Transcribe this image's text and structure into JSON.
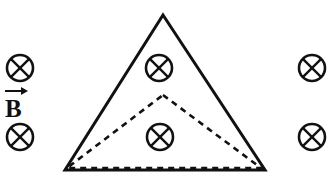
{
  "figure": {
    "background_color": "#ffffff",
    "stroke_color": "#111111",
    "width": 333,
    "height": 190,
    "field_label": {
      "symbol": "B",
      "arrow": "vector-arrow-right",
      "meaning": "magnetic field vector"
    },
    "field_markers": [
      {
        "name": "field-marker-left-top",
        "cx": 20,
        "cy": 68,
        "r": 13,
        "glyph": "circled-x",
        "region": "outside-left"
      },
      {
        "name": "field-marker-left-bottom",
        "cx": 20,
        "cy": 137,
        "r": 13,
        "glyph": "circled-x",
        "region": "outside-left"
      },
      {
        "name": "field-marker-right-top",
        "cx": 312,
        "cy": 68,
        "r": 13,
        "glyph": "circled-x",
        "region": "outside-right"
      },
      {
        "name": "field-marker-right-bottom",
        "cx": 312,
        "cy": 137,
        "r": 13,
        "glyph": "circled-x",
        "region": "outside-right"
      },
      {
        "name": "field-marker-inner-top",
        "cx": 159,
        "cy": 68,
        "r": 13,
        "glyph": "circled-x",
        "region": "inside-triangle"
      },
      {
        "name": "field-marker-inner-bottom",
        "cx": 160,
        "cy": 137,
        "r": 13,
        "glyph": "circled-x",
        "region": "inside-triangle"
      }
    ],
    "solid_triangle": {
      "name": "solid-triangle",
      "points": "163,15 265,170 65,170",
      "style": "solid",
      "stroke_width": 3
    },
    "dashed_triangle": {
      "name": "dashed-triangle",
      "points": "163,95 261,168 67,168",
      "style": "dashed",
      "stroke_width": 2.6,
      "dash_pattern": "6,5"
    }
  }
}
